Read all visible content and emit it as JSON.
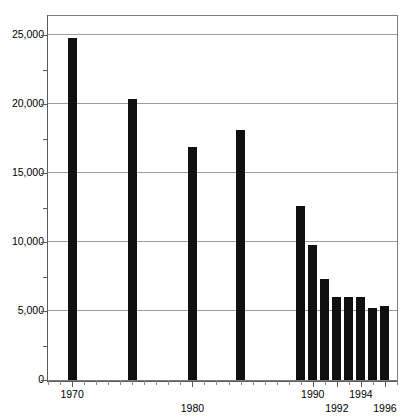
{
  "figure": {
    "clipped_top_text": "",
    "background_color": "#ffffff",
    "bar_color": "#101010",
    "axis_color": "#5a5a5a",
    "gridline_color": "#9c9c9c"
  },
  "chart_data": {
    "type": "bar",
    "title": "",
    "subtitle": "",
    "xlabel": "",
    "ylabel": "",
    "categories": [
      "1970",
      "1975",
      "1980",
      "1984",
      "1989",
      "1990",
      "1991",
      "1992",
      "1993",
      "1994",
      "1995",
      "1996"
    ],
    "values": [
      24800,
      20400,
      16900,
      18100,
      12600,
      9800,
      7300,
      6000,
      6000,
      6000,
      5200,
      5400
    ],
    "x": [
      1970,
      1975,
      1980,
      1984,
      1989,
      1990,
      1991,
      1992,
      1993,
      1994,
      1995,
      1996
    ],
    "xlim": [
      1968,
      1997
    ],
    "ylim": [
      0,
      26400
    ],
    "y_ticks": [
      0,
      5000,
      10000,
      15000,
      20000,
      25000
    ],
    "y_tick_labels": [
      "0",
      "5,000",
      "10,000",
      "15,000",
      "20,000",
      "25,000"
    ],
    "y_minor_ticks": [
      2500,
      7500,
      12500,
      17500,
      22500
    ],
    "x_tick_labels": [
      "1970",
      "1980",
      "1990",
      "1992",
      "1994",
      "1996"
    ],
    "x_minor_tick_interval": 1,
    "grid": "horizontal",
    "legend": "none",
    "annotations": []
  },
  "axis": {
    "y_labels": [
      {
        "text": "25,000",
        "value": 25000
      },
      {
        "text": "20,000",
        "value": 20000
      },
      {
        "text": "15,000",
        "value": 15000
      },
      {
        "text": "10,000",
        "value": 10000
      },
      {
        "text": "5,000",
        "value": 5000
      },
      {
        "text": "0",
        "value": 0
      }
    ],
    "x_labels": [
      {
        "text": "1970",
        "value": 1970,
        "row": 0
      },
      {
        "text": "1980",
        "value": 1980,
        "row": 1
      },
      {
        "text": "1990",
        "value": 1990,
        "row": 0
      },
      {
        "text": "1992",
        "value": 1992,
        "row": 1
      },
      {
        "text": "1994",
        "value": 1994,
        "row": 0
      },
      {
        "text": "1996",
        "value": 1996,
        "row": 1
      }
    ]
  }
}
